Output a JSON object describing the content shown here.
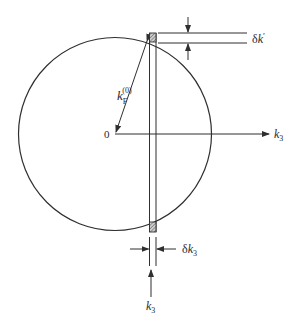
{
  "diagram": {
    "type": "fermi-sphere-cross-section",
    "labels": {
      "origin": "0",
      "radius_main": "k",
      "radius_sub": "F",
      "radius_sup": "(0)",
      "axis_main": "k",
      "axis_sub": "3",
      "delta_kprime_prefix": "δ",
      "delta_kprime_main": "k",
      "delta_kprime_prime": "′",
      "delta_k3_prefix": "δ",
      "delta_k3_main": "k",
      "delta_k3_sub": "3",
      "k3_marker_main": "k",
      "k3_marker_sub": "3"
    },
    "elements": [
      "circle (Fermi sphere)",
      "radius arrow from origin to sphere",
      "horizontal k3 axis arrow",
      "vertical thin slab at k3 with shaded intersection boxes",
      "δk′ dimension arrows",
      "δk3 dimension arrows",
      "k3 position marker arrow"
    ],
    "colors": {
      "ink": "#2f2f2f",
      "hatch": "#6a6a6a"
    }
  }
}
